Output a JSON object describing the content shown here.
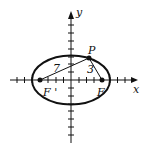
{
  "diagram": {
    "type": "ellipse-foci",
    "axes": {
      "x_label": "x",
      "y_label": "y"
    },
    "points": {
      "P": {
        "label": "P"
      },
      "F": {
        "label": "F"
      },
      "F_prime": {
        "label": "F '"
      }
    },
    "segments": {
      "PF_prime": {
        "label": "7"
      },
      "PF": {
        "label": "3"
      }
    },
    "colors": {
      "stroke": "#111111",
      "background": "#ffffff"
    }
  }
}
